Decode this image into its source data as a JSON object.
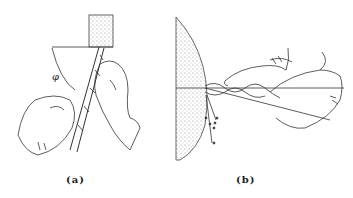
{
  "figure": {
    "panels": [
      {
        "id": "a",
        "label": "(a)",
        "angle_symbol": "φ",
        "description": "hands holding drill bit against grinding wheel at angle φ"
      },
      {
        "id": "b",
        "label": "(b)",
        "description": "hands rotating drill bit against grinding wheel surface with sparks"
      }
    ]
  },
  "colors": {
    "line": "#333333",
    "wheel_stipple": "#777777",
    "background": "#ffffff"
  }
}
